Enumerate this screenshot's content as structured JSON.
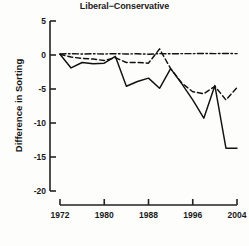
{
  "chart_data": {
    "type": "line",
    "title": "Liberal−Conservative",
    "xlabel": "",
    "ylabel": "Difference in Sorting",
    "xlim": [
      1972,
      2004
    ],
    "ylim": [
      -20,
      5
    ],
    "xticks": [
      1972,
      1980,
      1988,
      1996,
      2004
    ],
    "yticks": [
      5,
      0,
      -5,
      -10,
      -15,
      -20
    ],
    "grid": false,
    "legend": "none",
    "x": [
      1972,
      1974,
      1976,
      1978,
      1980,
      1982,
      1984,
      1986,
      1988,
      1990,
      1992,
      1994,
      1996,
      1998,
      2000,
      2002,
      2004
    ],
    "series": [
      {
        "name": "solid-line",
        "style": "solid",
        "color": "#111111",
        "values": [
          0.1,
          -1.9,
          -1.1,
          -1.3,
          -1.2,
          -0.2,
          -4.6,
          -3.9,
          -3.4,
          -4.9,
          -2.0,
          -4.2,
          -6.6,
          -9.3,
          -4.5,
          -13.7,
          -13.7
        ]
      },
      {
        "name": "dashed-line",
        "style": "dashed",
        "color": "#111111",
        "values": [
          0.1,
          -0.3,
          -0.5,
          -0.6,
          -0.8,
          -0.4,
          -1.1,
          -1.1,
          -1.2,
          0.9,
          -2.0,
          -4.1,
          -5.4,
          -5.7,
          -4.6,
          -6.6,
          -4.8
        ]
      },
      {
        "name": "dashdot-line",
        "style": "dashdot",
        "color": "#111111",
        "values": [
          0.15,
          0.2,
          0.15,
          0.18,
          0.15,
          0.2,
          0.15,
          0.18,
          0.12,
          0.2,
          0.18,
          0.2,
          0.2,
          0.22,
          0.2,
          0.22,
          0.2
        ]
      }
    ]
  },
  "axis": {
    "ytick_labels": [
      "5",
      "0",
      "-5",
      "-10",
      "-15",
      "-20"
    ],
    "xtick_labels": [
      "1972",
      "1980",
      "1988",
      "1996",
      "2004"
    ]
  },
  "caption": ""
}
